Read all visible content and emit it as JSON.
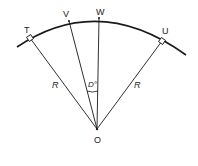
{
  "diagram": {
    "type": "circular-curve-geometry",
    "colors": {
      "stroke": "#1a1a1a",
      "background": "#ffffff"
    },
    "points": {
      "T": {
        "label": "T",
        "x": 30,
        "y": 38
      },
      "V": {
        "label": "V",
        "x": 69,
        "y": 20
      },
      "W": {
        "label": "W",
        "x": 99,
        "y": 18
      },
      "U": {
        "label": "U",
        "x": 162,
        "y": 41
      },
      "O": {
        "label": "O",
        "x": 97,
        "y": 129
      }
    },
    "labels": {
      "T": "T",
      "V": "V",
      "W": "W",
      "U": "U",
      "O": "O",
      "radius_left": "R",
      "radius_right": "R",
      "angle": "D°"
    },
    "segments": [
      {
        "from": "O",
        "to": "T",
        "label": "R"
      },
      {
        "from": "O",
        "to": "V"
      },
      {
        "from": "O",
        "to": "W"
      },
      {
        "from": "O",
        "to": "U",
        "label": "R"
      }
    ],
    "arc": {
      "from_x": 17,
      "from_y": 47,
      "to_x": 186,
      "to_y": 55,
      "through": "T, V, W, U"
    },
    "angle_marker": {
      "between": [
        "OV",
        "OW"
      ],
      "label": "D°"
    },
    "right_angle_markers": [
      "T",
      "U"
    ]
  }
}
